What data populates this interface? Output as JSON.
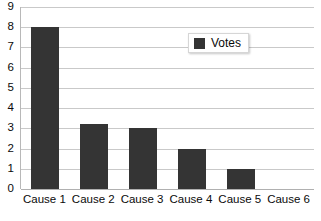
{
  "chart_data": {
    "type": "bar",
    "title": "",
    "subtitle": "",
    "xlabel": "",
    "ylabel": "",
    "categories": [
      "Cause 1",
      "Cause 2",
      "Cause 3",
      "Cause 4",
      "Cause 5",
      "Cause 6"
    ],
    "series": [
      {
        "name": "Votes",
        "values": [
          8,
          3.2,
          3,
          2,
          1,
          0
        ],
        "color": "#343434"
      }
    ],
    "ylim": [
      0,
      9
    ],
    "ytick_labels": [
      "9",
      "8",
      "7",
      "6",
      "5",
      "4",
      "3",
      "2",
      "1",
      "0"
    ],
    "ytick_values": [
      9,
      8,
      7,
      6,
      5,
      4,
      3,
      2,
      1,
      0
    ],
    "grid": "horizontal",
    "legend": {
      "position": "inside-top-right",
      "entries": [
        {
          "label": "Votes",
          "color": "#343434",
          "swatch": "legend-swatch-square"
        }
      ]
    },
    "colors": {
      "bar": "#343434",
      "gridline": "#c9c9c9",
      "axis": "#b8b8b8",
      "background": "#ffffff",
      "text": "#0a0a0a"
    }
  }
}
